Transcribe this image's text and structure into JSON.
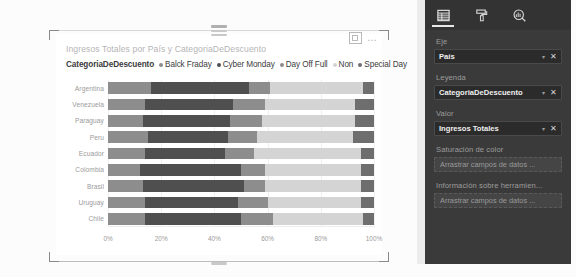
{
  "visual": {
    "title": "Ingresos Totales por País y CategoriaDeDescuento",
    "drag_handle": "drag-handle",
    "focus_icon": "focus-mode-icon",
    "more_icon": "…"
  },
  "legend": {
    "title": "CategoriaDeDescuento",
    "items": [
      {
        "label": "Balck Fraday",
        "color": "#8d8d8d"
      },
      {
        "label": "Cyber Monday",
        "color": "#4f4f4f"
      },
      {
        "label": "Day Off Full",
        "color": "#8d8d8d"
      },
      {
        "label": "Non",
        "color": "#d4d4d4"
      },
      {
        "label": "Special Day",
        "color": "#6e6e6e"
      }
    ]
  },
  "chart_data": {
    "type": "bar",
    "title": "Ingresos Totales por País y CategoriaDeDescuento",
    "orientation": "horizontal",
    "stacked": "100%",
    "xlabel": "",
    "ylabel": "",
    "xlim": [
      0,
      100
    ],
    "xticks": [
      "0%",
      "20%",
      "40%",
      "60%",
      "80%",
      "100%"
    ],
    "grid": true,
    "legend_position": "top",
    "categories": [
      "Argentina",
      "Venezuela",
      "Paraguay",
      "Peru",
      "Ecuador",
      "Colombia",
      "Brasil",
      "Uruguay",
      "Chile"
    ],
    "series": [
      {
        "name": "Balck Fraday",
        "color": "#8d8d8d",
        "values": [
          16,
          14,
          13,
          15,
          14,
          12,
          13,
          14,
          14
        ]
      },
      {
        "name": "Cyber Monday",
        "color": "#4f4f4f",
        "values": [
          37,
          33,
          33,
          30,
          30,
          38,
          38,
          35,
          36
        ]
      },
      {
        "name": "Day Off Full",
        "color": "#8d8d8d",
        "values": [
          8,
          12,
          12,
          11,
          11,
          9,
          8,
          11,
          12
        ]
      },
      {
        "name": "Non",
        "color": "#d4d4d4",
        "values": [
          35,
          34,
          35,
          36,
          40,
          36,
          36,
          35,
          34
        ]
      },
      {
        "name": "Special Day",
        "color": "#6e6e6e",
        "values": [
          4,
          7,
          7,
          8,
          5,
          5,
          5,
          5,
          4
        ]
      }
    ]
  },
  "pane": {
    "tabs": [
      {
        "name": "fields-tab",
        "icon": "fields-icon",
        "active": true
      },
      {
        "name": "format-tab",
        "icon": "paint-roller-icon",
        "active": false
      },
      {
        "name": "analytics-tab",
        "icon": "analytics-magnifier-icon",
        "active": false
      }
    ],
    "buckets": [
      {
        "label": "Eje",
        "field": "País",
        "chevron": "▾",
        "close": "✕"
      },
      {
        "label": "Leyenda",
        "field": "CategoriaDeDescuento",
        "chevron": "▾",
        "close": "✕"
      },
      {
        "label": "Valor",
        "field": "Ingresos Totales",
        "chevron": "▾",
        "close": "✕"
      }
    ],
    "empty_buckets": [
      {
        "label": "Saturación de color",
        "placeholder": "Arrastrar campos de datos ..."
      },
      {
        "label": "Información sobre herramien...",
        "placeholder": "Arrastrar campos de datos ..."
      }
    ]
  }
}
